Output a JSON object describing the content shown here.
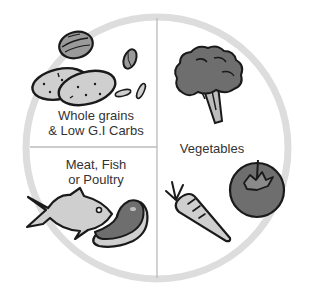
{
  "diagram": {
    "type": "plate-diagram",
    "colors": {
      "plate_rim": "#dddddd",
      "divider": "#bbbbbb",
      "outline": "#1a1a1a",
      "light_fill": "#cfcfcf",
      "mid_fill": "#9a9a9a",
      "dark_fill": "#6e6e6e",
      "text": "#333333"
    },
    "sections": [
      {
        "id": "grains",
        "label_line1": "Whole grains",
        "label_line2": "& Low G.I Carbs",
        "position": "top-left",
        "icons": [
          "walnut-icon",
          "almond-icon",
          "potato-icon",
          "potato-icon",
          "seed-icon",
          "seed-icon"
        ]
      },
      {
        "id": "protein",
        "label_line1": "Meat, Fish",
        "label_line2": "or Poultry",
        "position": "bottom-left",
        "icons": [
          "fish-icon",
          "steak-icon"
        ]
      },
      {
        "id": "vegetables",
        "label_line1": "Vegetables",
        "position": "right-half",
        "icons": [
          "broccoli-icon",
          "carrot-icon",
          "tomato-icon"
        ]
      }
    ]
  }
}
